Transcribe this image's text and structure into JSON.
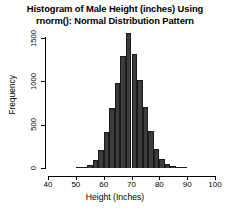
{
  "chart_data": {
    "type": "bar",
    "title": "Histogram of Male Height (inches) Using rnorm(): Normal Distribution Pattern",
    "title_lines": [
      "Histogram of Male Height (inches) Using",
      "rnorm(): Normal Distribution Pattern"
    ],
    "xlabel": "Height (Inches)",
    "ylabel": "Frequency",
    "xlim": [
      40,
      100
    ],
    "ylim": [
      0,
      1500
    ],
    "xticks": [
      40,
      50,
      60,
      70,
      80,
      90,
      100
    ],
    "xtick_labels": [
      "40",
      "50",
      "60",
      "70",
      "80",
      "90",
      "100"
    ],
    "yticks": [
      0,
      500,
      1000,
      1500
    ],
    "ytick_labels": [
      "0",
      "500",
      "1000",
      "1500"
    ],
    "grid": false,
    "legend": false,
    "bin_width": 2,
    "bar_color": "#3c3c3c",
    "bar_edge_color": "#1a1a1a",
    "background": "#ffffff",
    "bins": [
      {
        "x0": 50,
        "x1": 52,
        "value": 5
      },
      {
        "x0": 52,
        "x1": 54,
        "value": 12
      },
      {
        "x0": 54,
        "x1": 56,
        "value": 35
      },
      {
        "x0": 56,
        "x1": 58,
        "value": 95
      },
      {
        "x0": 58,
        "x1": 60,
        "value": 210
      },
      {
        "x0": 60,
        "x1": 62,
        "value": 420
      },
      {
        "x0": 62,
        "x1": 64,
        "value": 690
      },
      {
        "x0": 64,
        "x1": 66,
        "value": 980
      },
      {
        "x0": 66,
        "x1": 68,
        "value": 1290
      },
      {
        "x0": 68,
        "x1": 70,
        "value": 1560
      },
      {
        "x0": 70,
        "x1": 72,
        "value": 1310
      },
      {
        "x0": 72,
        "x1": 74,
        "value": 1020
      },
      {
        "x0": 74,
        "x1": 76,
        "value": 700
      },
      {
        "x0": 76,
        "x1": 78,
        "value": 430
      },
      {
        "x0": 78,
        "x1": 80,
        "value": 225
      },
      {
        "x0": 80,
        "x1": 82,
        "value": 105
      },
      {
        "x0": 82,
        "x1": 84,
        "value": 45
      },
      {
        "x0": 84,
        "x1": 86,
        "value": 18
      },
      {
        "x0": 86,
        "x1": 88,
        "value": 7
      },
      {
        "x0": 88,
        "x1": 90,
        "value": 3
      }
    ]
  }
}
